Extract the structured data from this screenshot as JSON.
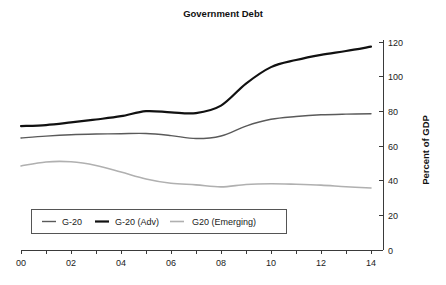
{
  "chart_data": {
    "type": "line",
    "title": "Government Debt",
    "xlabel": "",
    "ylabel": "Percent of GDP",
    "xlim": [
      0,
      14
    ],
    "ylim": [
      0,
      120
    ],
    "grid": false,
    "legend_position": "bottom-left",
    "x": [
      0,
      1,
      2,
      3,
      4,
      5,
      6,
      7,
      8,
      9,
      10,
      11,
      12,
      13,
      14
    ],
    "x_tick_values": [
      0,
      2,
      4,
      6,
      8,
      10,
      12,
      14
    ],
    "x_tick_labels": [
      "00",
      "02",
      "04",
      "06",
      "08",
      "10",
      "12",
      "14"
    ],
    "x_minor_tick_values": [
      0,
      1,
      2,
      3,
      4,
      5,
      6,
      7,
      8,
      9,
      10,
      11,
      12,
      13,
      14
    ],
    "y_tick_values": [
      0,
      20,
      40,
      60,
      80,
      100,
      120
    ],
    "y_tick_labels": [
      "0",
      "20",
      "40",
      "60",
      "80",
      "100",
      "120"
    ],
    "series": [
      {
        "name": "G-20",
        "color": "#5a5a5a",
        "width": 1.4,
        "values": [
          64.6,
          65.7,
          66.5,
          66.9,
          67.1,
          67.2,
          66.0,
          64.3,
          65.8,
          71.5,
          75.4,
          77.0,
          78.0,
          78.4,
          78.6
        ]
      },
      {
        "name": "G-20 (Adv)",
        "color": "#111111",
        "width": 2.2,
        "values": [
          71.5,
          72.1,
          73.6,
          75.3,
          77.2,
          80.1,
          79.4,
          79.0,
          83.3,
          96.0,
          105.5,
          109.6,
          112.6,
          114.8,
          117.3
        ]
      },
      {
        "name": "G20 (Emerging)",
        "color": "#b0b0b0",
        "width": 1.6,
        "values": [
          48.5,
          50.8,
          50.9,
          48.8,
          45.0,
          41.0,
          38.5,
          37.6,
          36.4,
          37.8,
          38.2,
          37.9,
          37.4,
          36.5,
          35.8
        ]
      }
    ]
  },
  "legend": {
    "entries": [
      {
        "label": "G-20"
      },
      {
        "label": "G-20 (Adv)"
      },
      {
        "label": "G20 (Emerging)"
      }
    ]
  }
}
